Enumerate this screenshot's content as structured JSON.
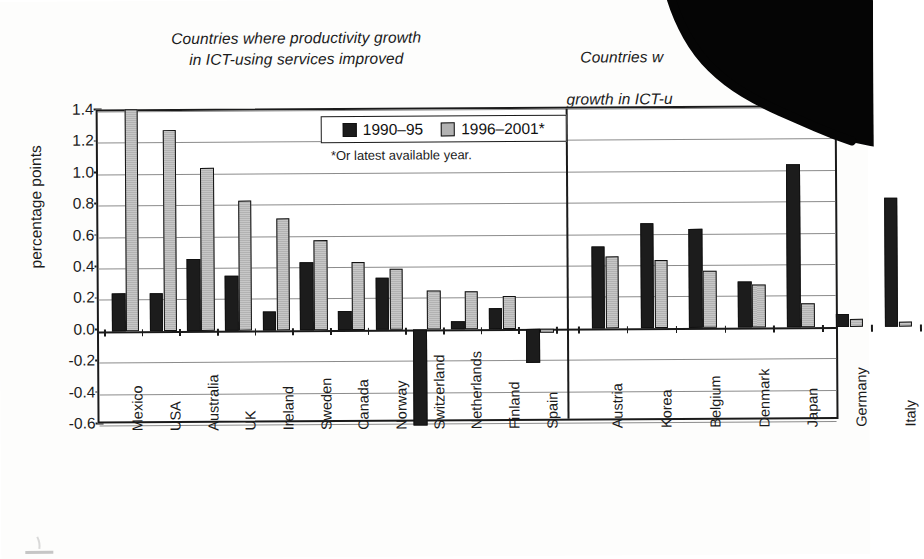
{
  "figure": {
    "y_axis_label": "percentage points",
    "legend_footnote": "*Or latest available year.",
    "caption_fragment": "Figure"
  },
  "panels": {
    "left_title": "Countries where productivity growth\nin ICT-using services improved",
    "right_title_line1": "Countries w",
    "right_title_line2": "growth in ICT-u",
    "right_title_line3": "deteriorated"
  },
  "legend": {
    "series": [
      {
        "label": "1990–95",
        "color": "#1c1c1c"
      },
      {
        "label": "1996–2001*",
        "color": "#b2b2b2"
      }
    ]
  },
  "chart_data": {
    "type": "bar",
    "xlabel": "",
    "ylabel": "percentage points",
    "ylim": [
      -0.6,
      1.4
    ],
    "ytick_labels": [
      "1.4",
      "1.2",
      "1.0",
      "0.8",
      "0.6",
      "0.4",
      "0.2",
      "0.0",
      "-0.2",
      "-0.4",
      "-0.6"
    ],
    "ytick_values": [
      1.4,
      1.2,
      1.0,
      0.8,
      0.6,
      0.4,
      0.2,
      0.0,
      -0.2,
      -0.4,
      -0.6
    ],
    "grid": true,
    "legend_position": "top-center",
    "panels": [
      {
        "name": "improved",
        "categories": [
          "Mexico",
          "USA",
          "Australia",
          "UK",
          "Ireland",
          "Sweden",
          "Canada",
          "Norway",
          "Switzerland",
          "Netherlands",
          "Finland",
          "Spain"
        ],
        "series": [
          {
            "name": "1990–95",
            "values": [
              0.24,
              0.24,
              0.46,
              0.35,
              0.12,
              0.43,
              0.12,
              0.33,
              -0.61,
              0.05,
              0.13,
              -0.22
            ]
          },
          {
            "name": "1996–2001*",
            "values": [
              1.41,
              1.28,
              1.04,
              0.83,
              0.71,
              0.57,
              0.43,
              0.39,
              0.25,
              0.24,
              0.21,
              -0.03
            ]
          }
        ]
      },
      {
        "name": "deteriorated",
        "categories": [
          "Austria",
          "Korea",
          "Belgium",
          "Denmark",
          "Japan",
          "Germany",
          "Italy"
        ],
        "series": [
          {
            "name": "1990–95",
            "values": [
              0.52,
              0.67,
              0.63,
              0.29,
              1.04,
              0.08,
              0.82
            ]
          },
          {
            "name": "1996–2001*",
            "values": [
              0.46,
              0.43,
              0.36,
              0.27,
              0.15,
              0.05,
              0.03
            ]
          }
        ]
      }
    ]
  }
}
